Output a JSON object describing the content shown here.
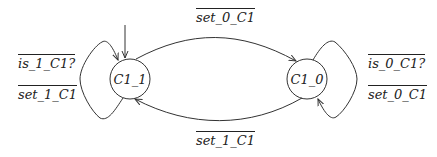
{
  "diagram": {
    "type": "state-machine",
    "states": [
      {
        "id": "C1_1",
        "label": "C1_1",
        "initial": true
      },
      {
        "id": "C1_0",
        "label": "C1_0",
        "initial": false
      }
    ],
    "transitions": [
      {
        "from": "C1_1",
        "to": "C1_0",
        "label": "set_0_C1"
      },
      {
        "from": "C1_0",
        "to": "C1_1",
        "label": "set_1_C1"
      },
      {
        "from": "C1_1",
        "to": "C1_1",
        "labels": [
          "is_1_C1?",
          "set_1_C1"
        ]
      },
      {
        "from": "C1_0",
        "to": "C1_0",
        "labels": [
          "is_0_C1?",
          "set_0_C1"
        ]
      }
    ]
  },
  "labels": {
    "top_edge": "set_0_C1",
    "bottom_edge": "set_1_C1",
    "left_loop_1": "is_1_C1?",
    "left_loop_2": "set_1_C1",
    "right_loop_1": "is_0_C1?",
    "right_loop_2": "set_0_C1",
    "state_left": "C1_1",
    "state_right": "C1_0"
  },
  "colors": {
    "stroke": "#333333",
    "background": "#ffffff"
  }
}
